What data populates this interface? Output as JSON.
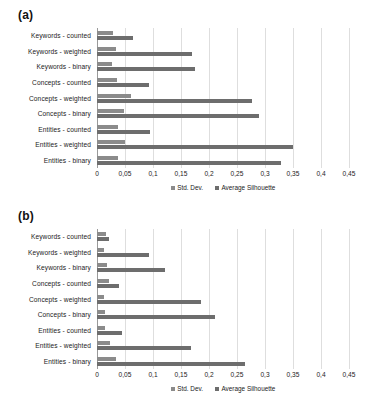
{
  "figure": {
    "panels": [
      {
        "id": "a",
        "label": "(a)",
        "chart_data": {
          "type": "bar",
          "orientation": "horizontal",
          "title": "",
          "xlabel": "",
          "ylabel": "",
          "xlim": [
            0,
            0.45
          ],
          "grid": true,
          "legend_position": "bottom",
          "decimal_separator": ",",
          "categories": [
            "Keywords - counted",
            "Keywords - weighted",
            "Keywords - binary",
            "Concepts - counted",
            "Concepts - weighted",
            "Concepts - binary",
            "Entities - counted",
            "Entities - weighted",
            "Entities - binary"
          ],
          "tick_labels": [
            "0",
            "0,05",
            "0,1",
            "0,15",
            "0,2",
            "0,25",
            "0,3",
            "0,35",
            "0,4",
            "0,45"
          ],
          "tick_values": [
            0,
            0.05,
            0.1,
            0.15,
            0.2,
            0.25,
            0.3,
            0.35,
            0.4,
            0.45
          ],
          "series": [
            {
              "name": "Std. Dev.",
              "color": "#8b8b8b",
              "values": [
                0.029,
                0.034,
                0.026,
                0.036,
                0.061,
                0.049,
                0.038,
                0.05,
                0.037
              ]
            },
            {
              "name": "Average Silhouette",
              "color": "#6d6d6d",
              "values": [
                0.064,
                0.169,
                0.175,
                0.092,
                0.276,
                0.29,
                0.095,
                0.35,
                0.328
              ]
            }
          ]
        }
      },
      {
        "id": "b",
        "label": "(b)",
        "chart_data": {
          "type": "bar",
          "orientation": "horizontal",
          "title": "",
          "xlabel": "",
          "ylabel": "",
          "xlim": [
            0,
            0.45
          ],
          "grid": true,
          "legend_position": "bottom",
          "decimal_separator": ",",
          "categories": [
            "Keywords - counted",
            "Keywords - weighted",
            "Keywords - binary",
            "Concepts - counted",
            "Concepts - weighted",
            "Concepts - binary",
            "Entities - counted",
            "Entities - weighted",
            "Entities - binary"
          ],
          "tick_labels": [
            "0",
            "0,05",
            "0,1",
            "0,15",
            "0,2",
            "0,25",
            "0,3",
            "0,35",
            "0,4",
            "0,45"
          ],
          "tick_values": [
            0,
            0.05,
            0.1,
            0.15,
            0.2,
            0.25,
            0.3,
            0.35,
            0.4,
            0.45
          ],
          "series": [
            {
              "name": "Std. Dev.",
              "color": "#8b8b8b",
              "values": [
                0.016,
                0.012,
                0.017,
                0.021,
                0.013,
                0.014,
                0.014,
                0.023,
                0.034
              ]
            },
            {
              "name": "Average Silhouette",
              "color": "#6d6d6d",
              "values": [
                0.021,
                0.093,
                0.121,
                0.04,
                0.185,
                0.21,
                0.044,
                0.168,
                0.265
              ]
            }
          ]
        }
      }
    ]
  }
}
